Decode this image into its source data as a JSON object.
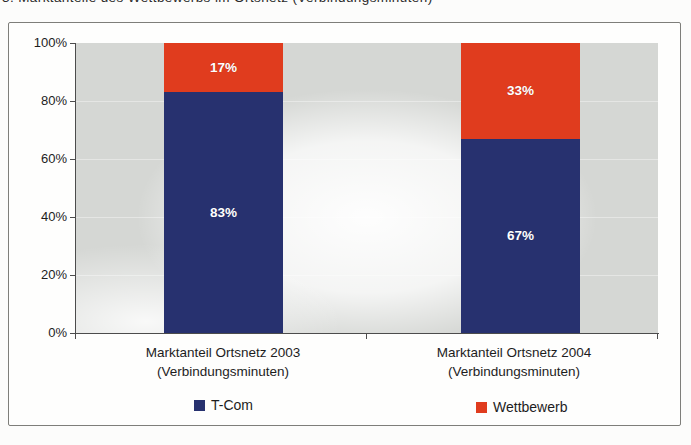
{
  "page": {
    "cropped_caption": "3. Marktanteile des Wettbewerbs im Ortsnetz (Verbindungsminuten)"
  },
  "colors": {
    "t_com_blue": "#27316F",
    "wettbewerb_red": "#E03C1E",
    "plot_area_gray": "#D5D7D4",
    "frame_border": "#7E7E7A"
  },
  "chart_data": {
    "type": "bar",
    "subtype": "stacked-100-percent",
    "title": "",
    "xlabel": "",
    "ylabel": "",
    "ylim": [
      0,
      100
    ],
    "y_ticks": [
      "100%",
      "80%",
      "60%",
      "40%",
      "20%",
      "0%"
    ],
    "grid": "faint horizontal gridlines every 20%",
    "legend_position": "bottom",
    "categories": [
      {
        "line1": "Marktanteil Ortsnetz 2003",
        "line2": "(Verbindungsminuten)"
      },
      {
        "line1": "Marktanteil Ortsnetz 2004",
        "line2": "(Verbindungsminuten)"
      }
    ],
    "series": [
      {
        "name": "T-Com",
        "color": "#27316F",
        "values": [
          83,
          67
        ],
        "labels": [
          "83%",
          "67%"
        ]
      },
      {
        "name": "Wettbewerb",
        "color": "#E03C1E",
        "values": [
          17,
          33
        ],
        "labels": [
          "17%",
          "33%"
        ]
      }
    ]
  }
}
